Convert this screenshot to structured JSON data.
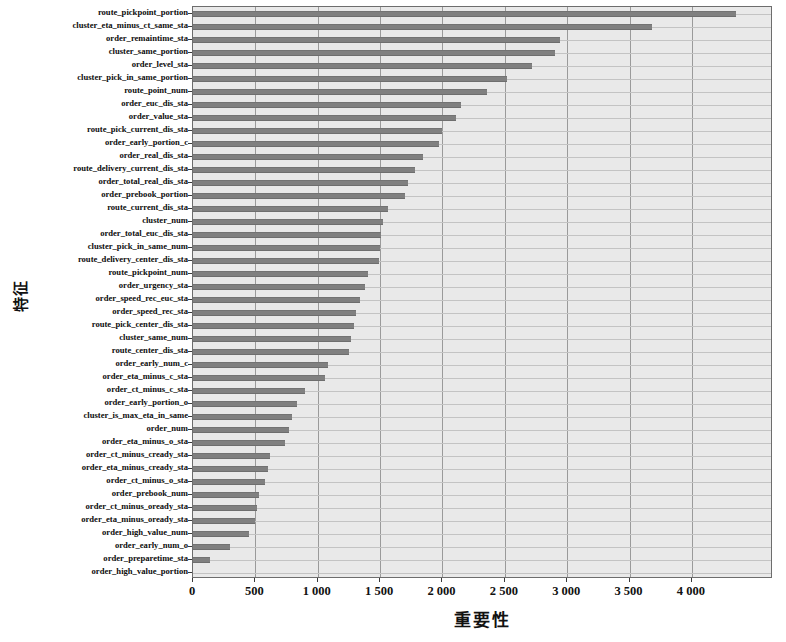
{
  "chart_data": {
    "type": "bar",
    "orientation": "horizontal",
    "title": "",
    "xlabel": "重要性",
    "ylabel": "特征",
    "xlim": [
      0,
      4650
    ],
    "grid": true,
    "legend": null,
    "bar_color": "#808080",
    "plot_background": "#e9e9e9",
    "xticks": [
      0,
      500,
      1000,
      1500,
      2000,
      2500,
      3000,
      3500,
      4000
    ],
    "xticklabels": [
      "0",
      "500",
      "1 000",
      "1 500",
      "2 000",
      "2 500",
      "3 000",
      "3 500",
      "4 000"
    ],
    "categories": [
      "route_pickpoint_portion",
      "cluster_eta_minus_ct_same_sta",
      "order_remaintime_sta",
      "cluster_same_portion",
      "order_level_sta",
      "cluster_pick_in_same_portion",
      "route_point_num",
      "order_euc_dis_sta",
      "order_value_sta",
      "route_pick_current_dis_sta",
      "order_early_portion_c",
      "order_real_dis_sta",
      "route_delivery_current_dis_sta",
      "order_total_real_dis_sta",
      "order_prebook_portion",
      "route_current_dis_sta",
      "cluster_num",
      "order_total_euc_dis_sta",
      "cluster_pick_in_same_num",
      "route_delivery_center_dis_sta",
      "route_pickpoint_num",
      "order_urgency_sta",
      "order_speed_rec_euc_sta",
      "order_speed_rec_sta",
      "route_pick_center_dis_sta",
      "cluster_same_num",
      "route_center_dis_sta",
      "order_early_num_c",
      "order_eta_minus_c_sta",
      "order_ct_minus_c_sta",
      "order_early_portion_o",
      "cluster_is_max_eta_in_same",
      "order_num",
      "order_eta_minus_o_sta",
      "order_ct_minus_cready_sta",
      "order_eta_minus_cready_sta",
      "order_ct_minus_o_sta",
      "order_prebook_num",
      "order_ct_minus_oready_sta",
      "order_eta_minus_oready_sta",
      "order_high_value_num",
      "order_early_num_o",
      "order_preparetime_sta",
      "order_high_value_portion"
    ],
    "values": [
      4350,
      3680,
      2940,
      2900,
      2720,
      2520,
      2360,
      2150,
      2110,
      2000,
      1970,
      1840,
      1780,
      1720,
      1700,
      1560,
      1520,
      1510,
      1500,
      1490,
      1400,
      1380,
      1340,
      1310,
      1290,
      1270,
      1250,
      1080,
      1060,
      900,
      830,
      790,
      770,
      740,
      620,
      600,
      580,
      530,
      510,
      500,
      450,
      300,
      140,
      0
    ]
  }
}
